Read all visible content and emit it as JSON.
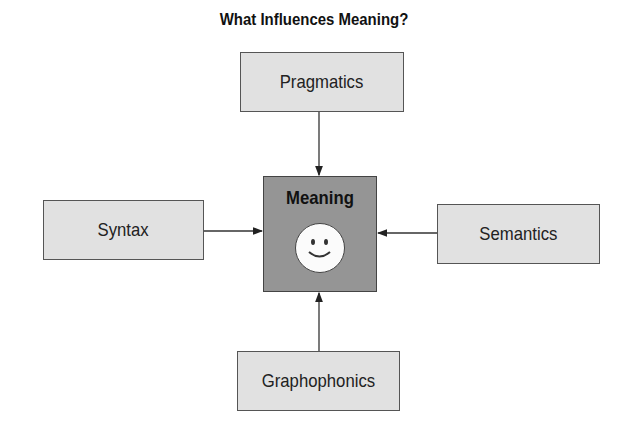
{
  "title": "What Influences Meaning?",
  "center": {
    "label": "Meaning",
    "icon": "smiley-face-icon"
  },
  "nodes": {
    "top": "Pragmatics",
    "left": "Syntax",
    "right": "Semantics",
    "bottom": "Graphophonics"
  },
  "edges": [
    {
      "from": "Pragmatics",
      "to": "Meaning"
    },
    {
      "from": "Syntax",
      "to": "Meaning"
    },
    {
      "from": "Semantics",
      "to": "Meaning"
    },
    {
      "from": "Graphophonics",
      "to": "Meaning"
    }
  ],
  "colors": {
    "outer_box": "#e1e1e1",
    "center_box": "#959595",
    "face": "#fbfbfb"
  }
}
